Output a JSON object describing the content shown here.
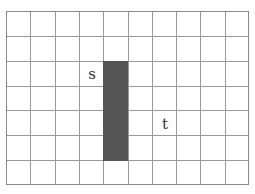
{
  "grid": {
    "columns": 10,
    "rows": 7,
    "line_color": "#9a9a9a",
    "border_color": "#8a8a8a"
  },
  "wall": {
    "column": 4,
    "row_start": 2,
    "row_end": 5,
    "color": "#555555"
  },
  "labels": [
    {
      "text": "s",
      "column": 3,
      "row": 2
    },
    {
      "text": "t",
      "column": 6,
      "row": 4
    }
  ]
}
